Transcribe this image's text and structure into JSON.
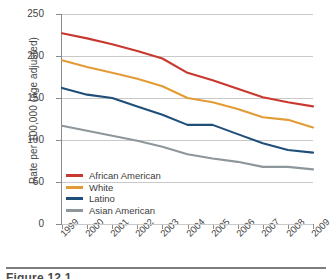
{
  "chart_data": {
    "type": "line",
    "title": "",
    "xlabel": "",
    "ylabel": "Rate per 100,000 (age adjusted)",
    "categories": [
      "1999",
      "2000",
      "2001",
      "2002",
      "2003",
      "2004",
      "2005",
      "2006",
      "2007",
      "2008",
      "2009"
    ],
    "ylim": [
      0,
      250
    ],
    "yticks": [
      0,
      50,
      100,
      150,
      200,
      250
    ],
    "grid": "horizontal",
    "legend_position": "lower-left inside plot",
    "series": [
      {
        "name": "African American",
        "color": "#c8382f",
        "values": [
          227,
          221,
          214,
          206,
          197,
          180,
          171,
          161,
          151,
          145,
          140
        ]
      },
      {
        "name": "White",
        "color": "#e39b36",
        "values": [
          195,
          187,
          180,
          173,
          164,
          150,
          145,
          137,
          127,
          124,
          115
        ]
      },
      {
        "name": "Latino",
        "color": "#1f4e79",
        "values": [
          162,
          154,
          150,
          140,
          130,
          118,
          118,
          107,
          96,
          88,
          85
        ]
      },
      {
        "name": "Asian American",
        "color": "#8d969b",
        "values": [
          117,
          111,
          105,
          99,
          92,
          83,
          78,
          74,
          68,
          68,
          65
        ]
      }
    ]
  },
  "ytick_labels": [
    "250",
    "200",
    "150",
    "100",
    "50",
    "0"
  ],
  "caption": {
    "text": "Figure 12.1"
  }
}
